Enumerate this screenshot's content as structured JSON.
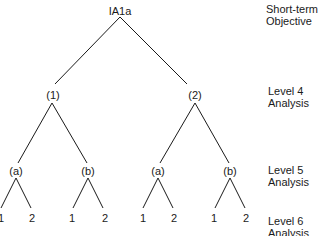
{
  "root": {
    "label": "IA1a"
  },
  "level4": [
    {
      "label": "(1)"
    },
    {
      "label": "(2)"
    }
  ],
  "level5": [
    {
      "label": "(a)"
    },
    {
      "label": "(b)"
    },
    {
      "label": "(a)"
    },
    {
      "label": "(b)"
    }
  ],
  "level6": [
    {
      "label": "1"
    },
    {
      "label": "2"
    },
    {
      "label": "1"
    },
    {
      "label": "2"
    },
    {
      "label": "1"
    },
    {
      "label": "2"
    },
    {
      "label": "1"
    },
    {
      "label": "2"
    }
  ],
  "levels": [
    {
      "line1": "Short-term",
      "line2": "Objective"
    },
    {
      "line1": "Level 4",
      "line2": "Analysis"
    },
    {
      "line1": "Level 5",
      "line2": "Analysis"
    },
    {
      "line1": "Level 6",
      "line2": "Analysis"
    }
  ]
}
